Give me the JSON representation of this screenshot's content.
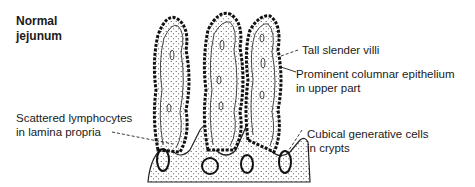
{
  "title": {
    "line1": "Normal",
    "line2": "jejunum"
  },
  "labels": [
    {
      "id": "tall-villi",
      "line1": "Tall slender villi",
      "line2": ""
    },
    {
      "id": "columnar-epithelium",
      "line1": "Prominent columnar epithelium",
      "line2": "in upper part"
    },
    {
      "id": "lymphocytes",
      "line1": "Scattered lymphocytes",
      "line2": "in lamina propria"
    },
    {
      "id": "generative-cells",
      "line1": "Cubical generative cells",
      "line2": "in crypts"
    }
  ]
}
